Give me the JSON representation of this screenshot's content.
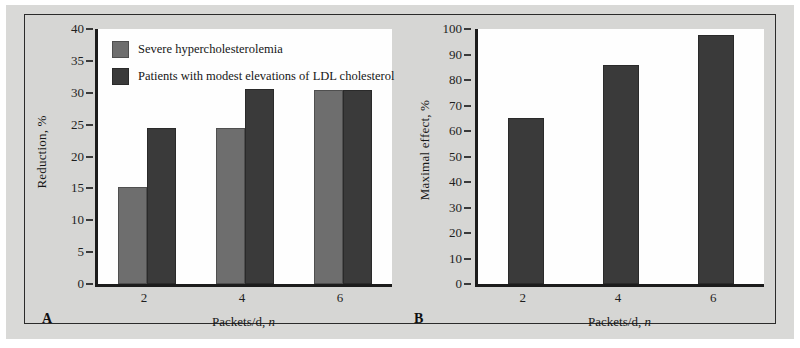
{
  "figure": {
    "background_color": "#d6d6d4",
    "plot_background_color": "#fefefe",
    "frame_color": "#2b2b2b"
  },
  "colors": {
    "series_light": "#6e6e6e",
    "series_dark": "#3a3a3a",
    "axis": "#1c1c1c",
    "text": "#171717"
  },
  "panels": {
    "a": {
      "letter": "A",
      "legend": [
        {
          "label": "Severe hypercholesterolemia",
          "color": "#6e6e6e"
        },
        {
          "label": "Patients with modest elevations of LDL cholesterol",
          "color": "#3a3a3a"
        }
      ]
    },
    "b": {
      "letter": "B"
    }
  },
  "chart_data": [
    {
      "type": "bar",
      "panel": "A",
      "title": "",
      "xlabel": "Packets/d, n",
      "ylabel": "Reduction, %",
      "categories": [
        "2",
        "4",
        "6"
      ],
      "ylim": [
        0,
        40
      ],
      "yticks": [
        0,
        5,
        10,
        15,
        20,
        25,
        30,
        35,
        40
      ],
      "ytick_labels": [
        "0",
        "5",
        "10",
        "15",
        "20",
        "25",
        "30",
        "35",
        "40"
      ],
      "grid": false,
      "legend_position": "upper-left-inside",
      "series": [
        {
          "name": "Severe hypercholesterolemia",
          "color": "#6e6e6e",
          "values": [
            15.2,
            24.5,
            30.5
          ]
        },
        {
          "name": "Patients with modest elevations of LDL cholesterol",
          "color": "#3a3a3a",
          "values": [
            24.4,
            30.6,
            30.5
          ]
        }
      ]
    },
    {
      "type": "bar",
      "panel": "B",
      "title": "",
      "xlabel": "Packets/d, n",
      "ylabel": "Maximal effect, %",
      "categories": [
        "2",
        "4",
        "6"
      ],
      "ylim": [
        0,
        100
      ],
      "yticks": [
        0,
        10,
        20,
        30,
        40,
        50,
        60,
        70,
        80,
        90,
        100
      ],
      "ytick_labels": [
        "0",
        "10",
        "20",
        "30",
        "40",
        "50",
        "60",
        "70",
        "80",
        "90",
        "100"
      ],
      "grid": false,
      "legend_position": "none",
      "series": [
        {
          "name": "Maximal effect",
          "color": "#3a3a3a",
          "values": [
            65.3,
            86.0,
            97.5
          ]
        }
      ]
    }
  ]
}
